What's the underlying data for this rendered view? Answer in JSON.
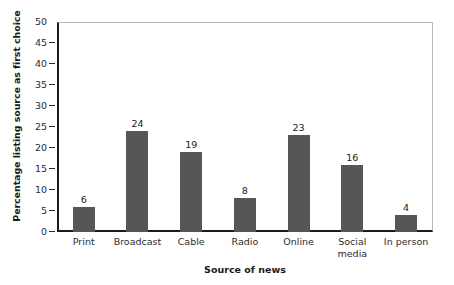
{
  "chart_data": {
    "type": "bar",
    "title": "",
    "xlabel": "Source of news",
    "ylabel": "Percentage listing source as first choice",
    "categories": [
      "Print",
      "Broadcast",
      "Cable",
      "Radio",
      "Online",
      "Social media",
      "In person"
    ],
    "values": [
      6,
      24,
      19,
      8,
      23,
      16,
      4
    ],
    "value_labels": [
      "6",
      "24",
      "19",
      "8",
      "23",
      "16",
      "4"
    ],
    "ylim": [
      0,
      50
    ],
    "ytick_values": [
      0,
      5,
      10,
      15,
      20,
      25,
      30,
      35,
      40,
      45,
      50
    ],
    "ytick_labels": [
      "0",
      "5",
      "10",
      "15",
      "20",
      "25",
      "30",
      "35",
      "40",
      "45",
      "50"
    ],
    "grid": false,
    "legend": null,
    "legend_position": "none",
    "bar_color": "#565656",
    "axis_color": "#1c1c1c",
    "frame_color": "#b8b8b8",
    "background_color": "#ffffff"
  }
}
